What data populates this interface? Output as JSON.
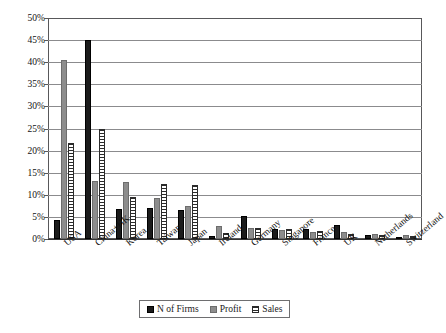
{
  "chart_data": {
    "type": "bar",
    "title": "",
    "xlabel": "",
    "ylabel": "",
    "ylim": [
      0,
      50
    ],
    "ytick_labels": [
      "50%",
      "45%",
      "40%",
      "35%",
      "30%",
      "25%",
      "20%",
      "15%",
      "10%",
      "5%",
      "0%"
    ],
    "ytick_values": [
      50,
      45,
      40,
      35,
      30,
      25,
      20,
      15,
      10,
      5,
      0
    ],
    "grid": true,
    "legend_position": "bottom",
    "categories": [
      "USA",
      "China+HK",
      "Korea",
      "Taiwan",
      "Japan",
      "Ireland",
      "Germany",
      "Singapore",
      "France",
      "UK",
      "Netherlands",
      "Switzerland"
    ],
    "series": [
      {
        "name": "N of Firms",
        "color": "#1b1b1b",
        "values": [
          4.3,
          45.0,
          6.7,
          7.0,
          6.5,
          0.6,
          5.1,
          2.3,
          2.3,
          3.2,
          0.9,
          0.4
        ]
      },
      {
        "name": "Profit",
        "color": "#8d8d8d",
        "values": [
          40.5,
          13.2,
          12.9,
          9.2,
          7.4,
          3.0,
          2.5,
          2.0,
          1.7,
          1.5,
          1.2,
          0.9
        ]
      },
      {
        "name": "Sales",
        "color": "#ffffff",
        "values": [
          21.7,
          25.0,
          9.6,
          12.4,
          12.2,
          1.3,
          2.4,
          2.2,
          1.8,
          1.2,
          1.0,
          0.7
        ]
      }
    ]
  },
  "legend": {
    "items": [
      {
        "label": "N of Firms",
        "key": "firms"
      },
      {
        "label": "Profit",
        "key": "profit"
      },
      {
        "label": "Sales",
        "key": "sales"
      }
    ]
  }
}
